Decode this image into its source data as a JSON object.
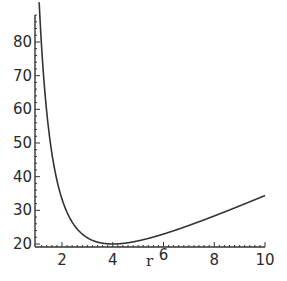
{
  "chart_data": {
    "type": "line",
    "title": "",
    "xlabel": "r",
    "ylabel": "",
    "xlim": [
      1.1,
      10
    ],
    "ylim": [
      20,
      88
    ],
    "xticks": [
      2,
      4,
      6,
      8,
      10
    ],
    "yticks": [
      20,
      30,
      40,
      50,
      60,
      70,
      80
    ],
    "grid": false,
    "legend": null,
    "series": [
      {
        "name": "f(r)",
        "x": [
          1.1,
          1.25,
          1.5,
          1.75,
          2,
          2.5,
          3,
          3.5,
          4,
          4.5,
          5,
          6,
          7,
          8,
          9,
          10
        ],
        "values": [
          91.8,
          72.4,
          52.4,
          40.7,
          33.3,
          25.4,
          21.9,
          20.4,
          20.0,
          20.3,
          21.0,
          23.0,
          25.5,
          28.3,
          31.3,
          34.4
        ]
      }
    ]
  }
}
